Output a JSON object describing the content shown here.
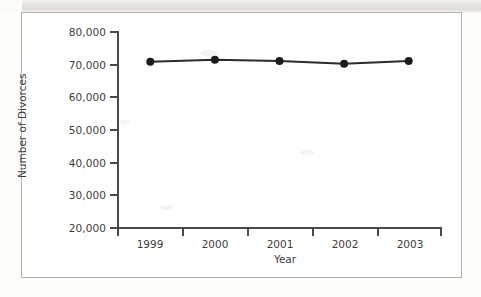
{
  "chart_data": {
    "type": "line",
    "title": "",
    "xlabel": "Year",
    "ylabel": "Number of Divorces",
    "categories": [
      "1999",
      "2000",
      "2001",
      "2002",
      "2003"
    ],
    "values": [
      70900,
      71500,
      71100,
      70300,
      71100
    ],
    "series": [
      {
        "name": "Number of Divorces",
        "values": [
          70900,
          71500,
          71100,
          70300,
          71100
        ]
      }
    ],
    "ylim": [
      20000,
      80000
    ],
    "y_tick_labels": [
      "80,000",
      "70,000",
      "60,000",
      "50,000",
      "40,000",
      "30,000",
      "20,000"
    ],
    "y_tick_values": [
      80000,
      70000,
      60000,
      50000,
      40000,
      30000,
      20000
    ],
    "x_tick_labels": [
      "1999",
      "2000",
      "2001",
      "2002",
      "2003"
    ],
    "grid": false,
    "legend": false,
    "legend_position": "none",
    "marker": "filled-circle",
    "line_color": "#2b2b2b",
    "marker_color": "#1c1c1c",
    "axis_color": "#4a4a4a",
    "text_color": "#3c3c3c",
    "background_color": "#ffffff",
    "frame_border_color": "#b3b3b3"
  },
  "figure": {
    "frame_label": "chart-frame",
    "scan_band_label": "scan-artifact-band"
  }
}
